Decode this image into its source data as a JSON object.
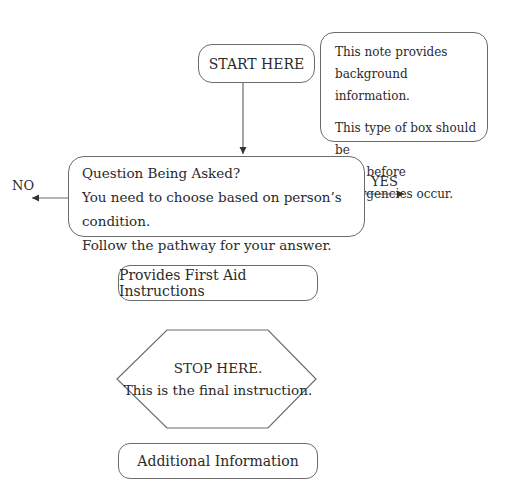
{
  "diagram": {
    "start": {
      "label": "START HERE"
    },
    "note": {
      "lines_1": [
        "This note provides",
        "background information."
      ],
      "lines_2": [
        "This type of box should be",
        "read before emergencies occur."
      ]
    },
    "question": {
      "title": "Question Being Asked?",
      "line_2": "You need to choose based on person’s condition.",
      "line_3": "Follow the pathway for your answer."
    },
    "branches": {
      "no": "NO",
      "yes": "YES"
    },
    "first_aid": {
      "label": "Provides First Aid Instructions"
    },
    "stop": {
      "line_1": "STOP HERE.",
      "line_2": "This is the final instruction."
    },
    "additional": {
      "label": "Additional Information"
    },
    "colors": {
      "stroke": "#6b6b6b",
      "text": "#2a2a2a",
      "background": "#ffffff"
    }
  }
}
